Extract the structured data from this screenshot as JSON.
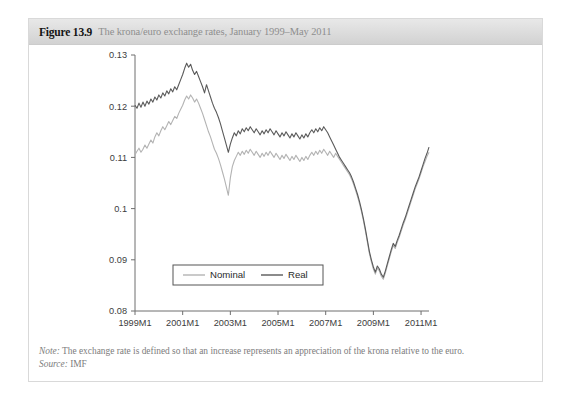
{
  "figure": {
    "number": "Figure 13.9",
    "title": "The krona/euro exchange rates, January 1999–May 2011"
  },
  "footnotes": {
    "note_label": "Note:",
    "note_text": " The exchange rate is defined so that an increase represents an appreciation of the krona relative to the euro.",
    "source_label": "Source:",
    "source_text": " IMF"
  },
  "colors": {
    "nominal": "#b3b3b3",
    "real": "#5a5a5a",
    "axis": "#6e6e6e",
    "header_text": "#8e8e8e",
    "card_border": "#d9d9d9"
  },
  "chart_data": {
    "type": "line",
    "title": "The krona/euro exchange rates, January 1999–May 2011",
    "xlabel": "",
    "ylabel": "",
    "grid": false,
    "legend_position": "bottom-center",
    "ylim": [
      0.08,
      0.13
    ],
    "yticks": [
      "0.08",
      "0.09",
      "0.1",
      "0.11",
      "0.12",
      "0.13"
    ],
    "ytick_values": [
      0.08,
      0.09,
      0.1,
      0.11,
      0.12,
      0.13
    ],
    "xticks": [
      "1999M1",
      "2001M1",
      "2003M1",
      "2005M1",
      "2007M1",
      "2009M1",
      "2011M1"
    ],
    "xtick_index": [
      0,
      24,
      48,
      72,
      96,
      120,
      144
    ],
    "xlim_index": [
      0,
      148
    ],
    "x_start": "1999M1",
    "x_end": "2011M5",
    "n_points": 149,
    "series": [
      {
        "name": "Nominal",
        "color": "#b3b3b3",
        "values": [
          0.1105,
          0.1112,
          0.1118,
          0.111,
          0.1116,
          0.1124,
          0.1118,
          0.1126,
          0.1134,
          0.1128,
          0.114,
          0.1148,
          0.1142,
          0.1152,
          0.116,
          0.1154,
          0.1162,
          0.117,
          0.1164,
          0.1172,
          0.118,
          0.1176,
          0.1186,
          0.1194,
          0.1202,
          0.1212,
          0.122,
          0.1214,
          0.1222,
          0.1216,
          0.1208,
          0.1214,
          0.1206,
          0.1196,
          0.1186,
          0.1174,
          0.1162,
          0.115,
          0.114,
          0.1128,
          0.1116,
          0.1108,
          0.1098,
          0.1086,
          0.1072,
          0.1058,
          0.1042,
          0.1026,
          0.106,
          0.1082,
          0.1094,
          0.1102,
          0.111,
          0.1104,
          0.1112,
          0.1106,
          0.1114,
          0.1108,
          0.1116,
          0.111,
          0.1104,
          0.1112,
          0.1106,
          0.11,
          0.1108,
          0.1102,
          0.111,
          0.1104,
          0.1112,
          0.1106,
          0.11,
          0.1108,
          0.1102,
          0.1096,
          0.1104,
          0.1098,
          0.1106,
          0.11,
          0.1094,
          0.1102,
          0.1096,
          0.1104,
          0.1098,
          0.1092,
          0.11,
          0.1094,
          0.1102,
          0.1096,
          0.1104,
          0.111,
          0.1104,
          0.1112,
          0.1106,
          0.1114,
          0.1108,
          0.1116,
          0.111,
          0.1104,
          0.1112,
          0.1106,
          0.11,
          0.1108,
          0.1102,
          0.1096,
          0.109,
          0.1084,
          0.1078,
          0.1072,
          0.1066,
          0.1058,
          0.1048,
          0.1036,
          0.1024,
          0.101,
          0.0994,
          0.0976,
          0.0956,
          0.0934,
          0.0912,
          0.0896,
          0.0882,
          0.0872,
          0.0884,
          0.0878,
          0.0868,
          0.0862,
          0.0874,
          0.0888,
          0.0902,
          0.0916,
          0.0928,
          0.0922,
          0.0934,
          0.0944,
          0.0956,
          0.0968,
          0.0978,
          0.099,
          0.1002,
          0.1014,
          0.1026,
          0.1038,
          0.1048,
          0.1058,
          0.107,
          0.1082,
          0.1092,
          0.1102,
          0.111
        ]
      },
      {
        "name": "Real",
        "color": "#5a5a5a",
        "values": [
          0.1202,
          0.1196,
          0.1206,
          0.1198,
          0.1208,
          0.12,
          0.121,
          0.1204,
          0.1214,
          0.1208,
          0.1218,
          0.1212,
          0.1222,
          0.1216,
          0.1226,
          0.122,
          0.123,
          0.1224,
          0.1234,
          0.1228,
          0.1238,
          0.1232,
          0.1242,
          0.1252,
          0.1262,
          0.1274,
          0.1284,
          0.1276,
          0.1282,
          0.127,
          0.1262,
          0.1268,
          0.1258,
          0.1248,
          0.1238,
          0.1226,
          0.1242,
          0.123,
          0.1218,
          0.1206,
          0.1196,
          0.1188,
          0.1178,
          0.1166,
          0.1152,
          0.1138,
          0.1124,
          0.111,
          0.1126,
          0.1138,
          0.1148,
          0.1142,
          0.1152,
          0.1146,
          0.1156,
          0.115,
          0.1158,
          0.1152,
          0.116,
          0.1154,
          0.1148,
          0.1156,
          0.115,
          0.1144,
          0.1152,
          0.1146,
          0.1154,
          0.1148,
          0.1156,
          0.115,
          0.1144,
          0.1152,
          0.1146,
          0.114,
          0.1148,
          0.1142,
          0.115,
          0.1144,
          0.1138,
          0.1146,
          0.114,
          0.1148,
          0.1142,
          0.1136,
          0.1144,
          0.1138,
          0.1146,
          0.114,
          0.1148,
          0.1154,
          0.1148,
          0.1156,
          0.115,
          0.1158,
          0.1152,
          0.116,
          0.1154,
          0.1148,
          0.114,
          0.1132,
          0.1124,
          0.1116,
          0.1108,
          0.11,
          0.1094,
          0.1088,
          0.1082,
          0.1076,
          0.107,
          0.1062,
          0.1052,
          0.104,
          0.1028,
          0.1014,
          0.0998,
          0.098,
          0.096,
          0.0938,
          0.0916,
          0.09,
          0.0886,
          0.0876,
          0.0888,
          0.0882,
          0.0872,
          0.0866,
          0.0878,
          0.0892,
          0.0906,
          0.092,
          0.0932,
          0.0926,
          0.0938,
          0.0948,
          0.096,
          0.0972,
          0.0982,
          0.0994,
          0.1006,
          0.1018,
          0.103,
          0.1042,
          0.1052,
          0.1062,
          0.1074,
          0.1086,
          0.1098,
          0.1108,
          0.112
        ]
      }
    ]
  }
}
